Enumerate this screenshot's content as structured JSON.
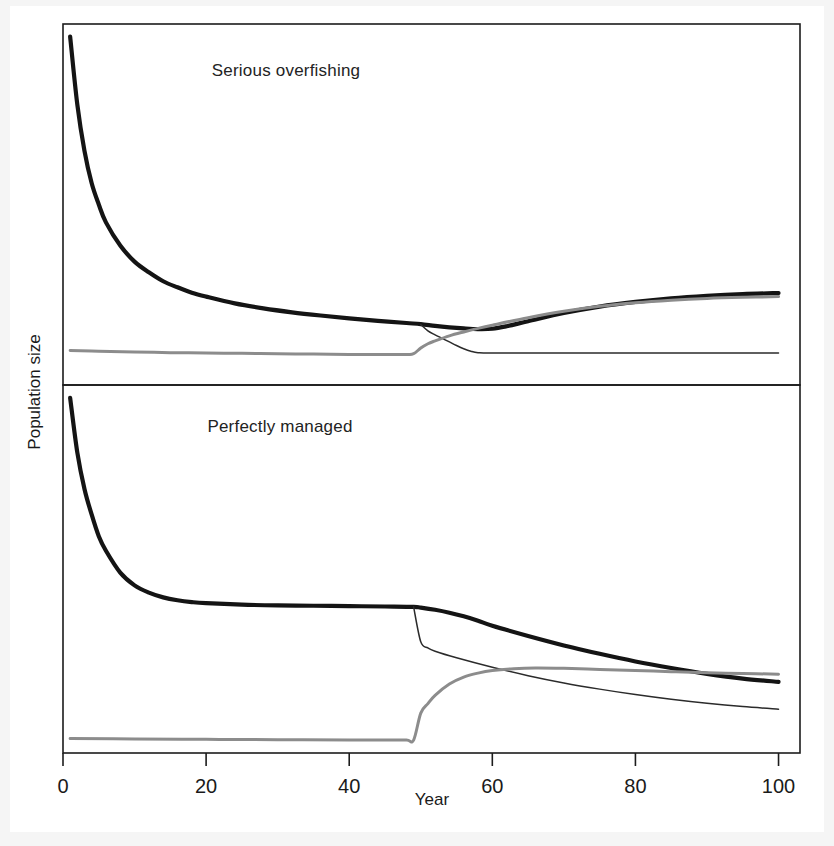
{
  "figure": {
    "background": "#f5f5f5",
    "paper": "#ffffff",
    "axis_color": "#1c1c1c"
  },
  "axes": {
    "xlabel": "Year",
    "ylabel": "Population size",
    "xticks": [
      "0",
      "20",
      "40",
      "60",
      "80",
      "100"
    ],
    "xtick_values": [
      0,
      20,
      40,
      60,
      80,
      100
    ],
    "xlim": [
      0,
      103
    ],
    "yticks": []
  },
  "chart_data": {
    "type": "line",
    "title": "",
    "xlabel": "Year",
    "ylabel": "Population size",
    "xlim": [
      0,
      103
    ],
    "ylim": [
      0,
      100
    ],
    "grid": false,
    "legend": "none",
    "panels": [
      {
        "id": "serious-overfishing",
        "title": "Serious overfishing",
        "title_x": 52,
        "ylim": [
          0,
          100
        ],
        "series": [
          {
            "name": "total-population",
            "style": "thick-black",
            "color": "#141414",
            "width": 4.2,
            "x": [
              1,
              2,
              3,
              4,
              5,
              6,
              8,
              10,
              12,
              14,
              16,
              18,
              20,
              24,
              28,
              32,
              36,
              40,
              44,
              48,
              50,
              52,
              54,
              56,
              58,
              60,
              62,
              65,
              70,
              75,
              80,
              85,
              90,
              95,
              100
            ],
            "y": [
              97,
              78,
              65,
              56,
              50,
              45,
              38.5,
              34,
              31,
              28.5,
              26.8,
              25.3,
              24.2,
              22.3,
              20.9,
              19.8,
              18.9,
              18.1,
              17.4,
              16.8,
              16.5,
              16.0,
              15.6,
              15.3,
              15.1,
              15.2,
              15.9,
              17.3,
              19.6,
              21.4,
              22.7,
              23.7,
              24.4,
              24.9,
              25.2
            ]
          },
          {
            "name": "mature-adults",
            "style": "thin-black",
            "color": "#2b2b2b",
            "width": 1.5,
            "x": [
              50,
              51,
              52,
              53,
              54,
              55,
              56,
              57,
              58,
              60,
              70,
              80,
              90,
              100
            ],
            "y": [
              16.4,
              14.6,
              13.5,
              12.5,
              11.5,
              10.5,
              9.6,
              8.9,
              8.5,
              8.4,
              8.4,
              8.4,
              8.4,
              8.4
            ]
          },
          {
            "name": "recruits-juveniles",
            "style": "gray",
            "color": "#8c8c8c",
            "width": 3.0,
            "x": [
              1,
              5,
              10,
              15,
              20,
              25,
              30,
              35,
              40,
              45,
              48,
              49,
              50,
              51,
              52,
              54,
              56,
              58,
              60,
              65,
              70,
              75,
              80,
              85,
              90,
              95,
              100
            ],
            "y": [
              9.1,
              8.9,
              8.7,
              8.5,
              8.4,
              8.3,
              8.2,
              8.1,
              8.0,
              8.0,
              8.0,
              8.2,
              9.8,
              11.0,
              11.8,
              13.2,
              14.3,
              15.3,
              16.2,
              18.3,
              20.1,
              21.5,
              22.5,
              23.2,
              23.7,
              24.0,
              24.2
            ]
          }
        ]
      },
      {
        "id": "perfectly-managed",
        "title": "Perfectly managed",
        "title_x": 50,
        "ylim": [
          0,
          100
        ],
        "series": [
          {
            "name": "total-population",
            "style": "thick-black",
            "color": "#141414",
            "width": 4.2,
            "x": [
              1,
              2,
              3,
              4,
              5,
              6,
              8,
              10,
              12,
              14,
              16,
              18,
              20,
              25,
              30,
              35,
              40,
              45,
              49,
              50,
              52,
              54,
              56,
              58,
              60,
              65,
              70,
              75,
              80,
              85,
              90,
              95,
              100
            ],
            "y": [
              97,
              82,
              72,
              65,
              59,
              55,
              49,
              45.5,
              43.5,
              42.2,
              41.4,
              40.9,
              40.6,
              40.2,
              40.0,
              39.9,
              39.8,
              39.7,
              39.6,
              39.4,
              38.8,
              38.0,
              37.0,
              35.8,
              34.4,
              31.6,
              29.0,
              26.7,
              24.6,
              22.8,
              21.2,
              19.9,
              19.0
            ]
          },
          {
            "name": "mature-adults",
            "style": "thin-black",
            "color": "#2b2b2b",
            "width": 1.5,
            "x": [
              49,
              50,
              51,
              52,
              55,
              60,
              65,
              70,
              75,
              80,
              85,
              90,
              95,
              100
            ],
            "y": [
              39.6,
              30.0,
              28.3,
              27.4,
              25.6,
              23.0,
              20.7,
              18.7,
              17.0,
              15.5,
              14.2,
              13.1,
              12.2,
              11.5
            ]
          },
          {
            "name": "recruits-juveniles",
            "style": "gray",
            "color": "#8c8c8c",
            "width": 3.0,
            "x": [
              1,
              10,
              20,
              30,
              40,
              45,
              48,
              49,
              50,
              51,
              52,
              54,
              56,
              58,
              60,
              63,
              66,
              70,
              75,
              80,
              85,
              90,
              95,
              100
            ],
            "y": [
              3.4,
              3.3,
              3.2,
              3.1,
              3.0,
              3.0,
              3.0,
              3.0,
              10.4,
              13.0,
              15.3,
              18.4,
              20.3,
              21.4,
              22.1,
              22.6,
              22.8,
              22.7,
              22.4,
              22.1,
              21.8,
              21.5,
              21.3,
              21.1
            ]
          }
        ]
      }
    ]
  }
}
